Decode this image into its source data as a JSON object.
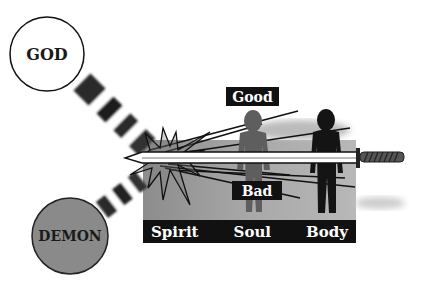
{
  "diagram": {
    "entities": {
      "god": {
        "label": "GOD",
        "fill": "#ffffff",
        "stroke": "#111111"
      },
      "demon": {
        "label": "DEMON",
        "fill": "#8a8a8a",
        "stroke": "#222222"
      }
    },
    "moral_labels": {
      "good": "Good",
      "bad": "Bad"
    },
    "parts": [
      "Spirit",
      "Soul",
      "Body"
    ],
    "colors": {
      "label_bg": "#111111",
      "label_text": "#ffffff",
      "panel": "#9a9a9a",
      "soul_figure": "#5a5a5a",
      "body_figure": "#141414"
    }
  }
}
